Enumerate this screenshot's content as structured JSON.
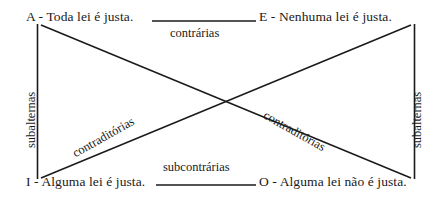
{
  "diagram": {
    "background_color": "#ffffff",
    "line_color": "#1a1a1a",
    "text_color": "#1a1a1a",
    "vertices": [
      {
        "key": "A",
        "text": "A - Toda lei é justa.",
        "position": "top-left"
      },
      {
        "key": "E",
        "text": "E - Nenhuma lei é justa.",
        "position": "top-right"
      },
      {
        "key": "I",
        "text": "I - Alguma lei é justa.",
        "position": "bottom-left"
      },
      {
        "key": "O",
        "text": "O - Alguma lei não é justa.",
        "position": "bottom-right"
      }
    ],
    "relations": {
      "top": "contrárias",
      "bottom": "subcontrárias",
      "left": "subalternas",
      "right": "subalternas",
      "diagonal_left": "contraditórias",
      "diagonal_right": "contraditórias"
    }
  }
}
